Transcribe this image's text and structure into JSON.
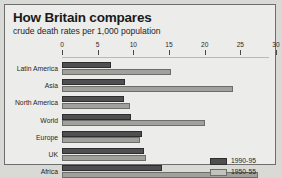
{
  "chart_data": {
    "type": "bar",
    "orientation": "horizontal",
    "title": "How Britain compares",
    "subtitle": "crude death rates per 1,000 population",
    "xlabel": "",
    "ylabel": "",
    "xlim": [
      0,
      30
    ],
    "xticks": [
      0,
      5,
      10,
      15,
      20,
      25,
      30
    ],
    "xtick_labels": [
      "0",
      "5",
      "10",
      "15",
      "20",
      "25",
      "30"
    ],
    "grid": false,
    "legend_position": "center-right",
    "categories": [
      "Latin America",
      "Asia",
      "North America",
      "World",
      "Europe",
      "UK",
      "Africa"
    ],
    "series": [
      {
        "name": "1990-95",
        "color": "#4f4f4f",
        "values": [
          6.8,
          8.8,
          8.7,
          9.7,
          11.2,
          11.5,
          14.0
        ]
      },
      {
        "name": "1950-55",
        "color": "#a0a09c",
        "values": [
          15.3,
          24.0,
          9.5,
          20.0,
          11.0,
          11.8,
          27.5
        ]
      }
    ]
  }
}
